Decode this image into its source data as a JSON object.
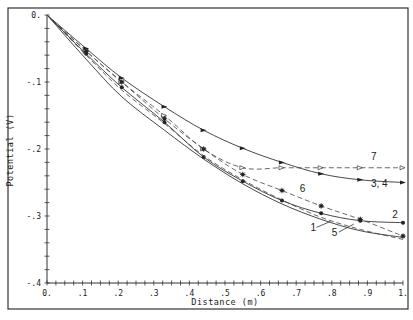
{
  "chart_data": {
    "type": "line",
    "title": "",
    "xlabel": "Distance (m)",
    "ylabel": "Potential (V)",
    "xlim": [
      0,
      1
    ],
    "ylim": [
      -0.4,
      0
    ],
    "x_tick_labels": [
      "0.",
      ".1",
      ".2",
      ".3",
      ".4",
      ".5",
      ".6",
      ".7",
      ".8",
      ".9",
      "1."
    ],
    "y_tick_labels": [
      "0.",
      "-.1",
      "-.2",
      "-.3",
      "-.4"
    ],
    "grid": false,
    "legend": "inline curve labels",
    "x": [
      0,
      0.11,
      0.21,
      0.33,
      0.44,
      0.55,
      0.66,
      0.77,
      0.88,
      1.0
    ],
    "series": [
      {
        "name": "3, 4",
        "style": "solid",
        "marker": "filled-triangle",
        "values": [
          0,
          -0.05,
          -0.094,
          -0.137,
          -0.172,
          -0.199,
          -0.22,
          -0.237,
          -0.246,
          -0.25
        ]
      },
      {
        "name": "7",
        "style": "dashed",
        "marker": "open-triangle",
        "values": [
          0,
          -0.054,
          -0.1,
          -0.15,
          -0.2,
          -0.228,
          -0.228,
          -0.228,
          -0.228,
          -0.228
        ]
      },
      {
        "name": "6",
        "style": "dashed",
        "marker": "asterisk",
        "values": [
          0,
          -0.054,
          -0.1,
          -0.155,
          -0.2,
          -0.238,
          -0.262,
          -0.285,
          -0.305,
          -0.33
        ]
      },
      {
        "name": "2",
        "style": "solid",
        "marker": "filled-dot",
        "values": [
          0,
          -0.058,
          -0.108,
          -0.16,
          -0.212,
          -0.248,
          -0.277,
          -0.296,
          -0.307,
          -0.31
        ]
      },
      {
        "name": "1",
        "style": "solid",
        "marker": "none",
        "values": [
          0,
          -0.066,
          -0.122,
          -0.172,
          -0.215,
          -0.252,
          -0.282,
          -0.305,
          -0.322,
          -0.332
        ]
      },
      {
        "name": "5",
        "style": "dashed",
        "marker": "none",
        "values": [
          0,
          -0.06,
          -0.112,
          -0.162,
          -0.21,
          -0.246,
          -0.276,
          -0.302,
          -0.32,
          -0.335
        ]
      }
    ],
    "annotations": [
      {
        "text": "7",
        "x": 0.91,
        "y": -0.216
      },
      {
        "text": "3, 4",
        "x": 0.91,
        "y": -0.257
      },
      {
        "text": "6",
        "x": 0.71,
        "y": -0.264
      },
      {
        "text": "2",
        "x": 0.97,
        "y": -0.303
      },
      {
        "text": "1",
        "x": 0.74,
        "y": -0.323
      },
      {
        "text": "5",
        "x": 0.8,
        "y": -0.33
      }
    ]
  }
}
